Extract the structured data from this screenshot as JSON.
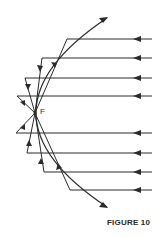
{
  "figure": {
    "caption": "FIGURE 10",
    "focus_label": "F",
    "colors": {
      "line": "#2a2a2a",
      "background": "#ffffff"
    },
    "incoming_rays_count": 8,
    "incoming_ray_direction": "right-to-left"
  }
}
